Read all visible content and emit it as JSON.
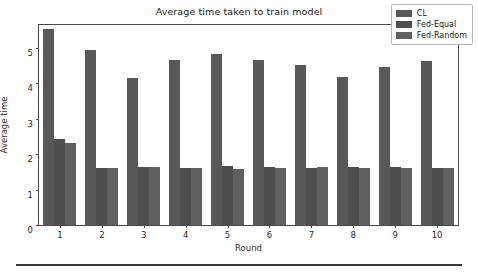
{
  "chart_data": {
    "type": "bar",
    "title": "Average time taken to train model",
    "xlabel": "Round",
    "ylabel": "Average time",
    "categories": [
      "1",
      "2",
      "3",
      "4",
      "5",
      "6",
      "7",
      "8",
      "9",
      "10"
    ],
    "series": [
      {
        "name": "CL",
        "color": "#585858",
        "values": [
          5.55,
          4.94,
          4.15,
          4.67,
          4.82,
          4.67,
          4.52,
          4.17,
          4.47,
          4.63
        ]
      },
      {
        "name": "Fed-Equal",
        "color": "#4e4e4e",
        "values": [
          2.43,
          1.61,
          1.63,
          1.61,
          1.67,
          1.64,
          1.61,
          1.63,
          1.64,
          1.62
        ]
      },
      {
        "name": "Fed-Random",
        "color": "#606060",
        "values": [
          2.33,
          1.61,
          1.63,
          1.61,
          1.59,
          1.62,
          1.63,
          1.61,
          1.62,
          1.62
        ]
      }
    ],
    "ylim": [
      0,
      5.65
    ],
    "yticks": [
      "0",
      "1",
      "2",
      "3",
      "4",
      "5"
    ],
    "ytick_values": [
      0,
      1,
      2,
      3,
      4,
      5
    ],
    "xticks": [
      "1",
      "2",
      "3",
      "4",
      "5",
      "6",
      "7",
      "8",
      "9",
      "10"
    ],
    "grid": false,
    "legend_position": "upper right",
    "legend_entries": [
      "CL",
      "Fed-Equal",
      "Fed-Random"
    ]
  }
}
